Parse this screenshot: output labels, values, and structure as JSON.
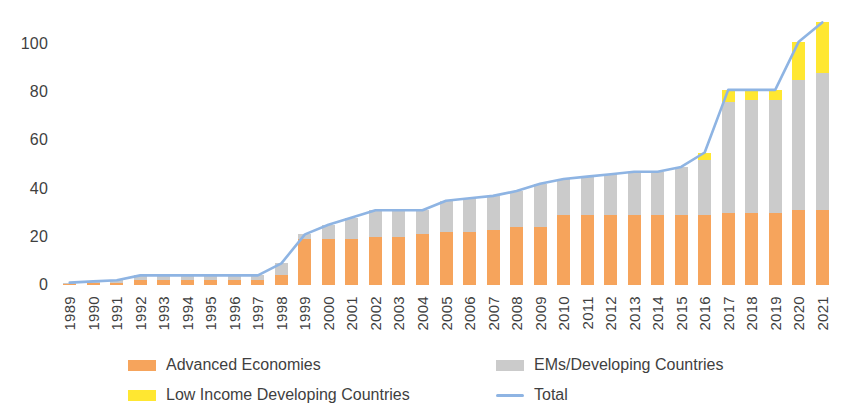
{
  "chart_data": {
    "type": "bar",
    "title": "",
    "subtitle": "",
    "xlabel": "",
    "ylabel": "",
    "stacked": true,
    "grid": false,
    "legend_position": "bottom",
    "ylim": [
      0,
      110
    ],
    "yticks": [
      0,
      20,
      40,
      60,
      80,
      100
    ],
    "categories": [
      "1989",
      "1990",
      "1991",
      "1992",
      "1993",
      "1994",
      "1995",
      "1996",
      "1997",
      "1998",
      "1999",
      "2000",
      "2001",
      "2002",
      "2003",
      "2004",
      "2005",
      "2006",
      "2007",
      "2008",
      "2009",
      "2010",
      "2011",
      "2012",
      "2013",
      "2014",
      "2015",
      "2016",
      "2017",
      "2018",
      "2019",
      "2020",
      "2021"
    ],
    "series": [
      {
        "name": "Advanced Economies",
        "color": "#F6A45C",
        "values": [
          0.5,
          0.7,
          1.0,
          2.0,
          2.0,
          2.0,
          2.0,
          2.0,
          2.0,
          4.0,
          19.0,
          19.0,
          19.0,
          20.0,
          20.0,
          21.0,
          22.0,
          22.0,
          23.0,
          24.0,
          24.0,
          29.0,
          29.0,
          29.0,
          29.0,
          29.0,
          29.0,
          29.0,
          30.0,
          30.0,
          30.0,
          31.0,
          31.0
        ]
      },
      {
        "name": "EMs/Developing Countries",
        "color": "#CBCBCB",
        "values": [
          0.5,
          0.8,
          1.0,
          2.0,
          2.0,
          2.0,
          2.0,
          2.0,
          2.0,
          5.0,
          2.0,
          6.0,
          9.0,
          11.0,
          11.0,
          10.0,
          13.0,
          14.0,
          14.0,
          15.0,
          18.0,
          15.0,
          16.0,
          17.0,
          18.0,
          18.0,
          20.0,
          23.0,
          46.0,
          47.0,
          47.0,
          54.0,
          57.0
        ]
      },
      {
        "name": "Low Income Developing Countries",
        "color": "#FFE731",
        "values": [
          0.0,
          0.0,
          0.0,
          0.0,
          0.0,
          0.0,
          0.0,
          0.0,
          0.0,
          0.0,
          0.0,
          0.0,
          0.0,
          0.0,
          0.0,
          0.0,
          0.0,
          0.0,
          0.0,
          0.0,
          0.0,
          0.0,
          0.0,
          0.0,
          0.0,
          0.0,
          0.0,
          3.0,
          5.0,
          4.0,
          4.0,
          16.0,
          21.0
        ]
      }
    ],
    "total_line": {
      "name": "Total",
      "color": "#8EB4E3",
      "values": [
        1.0,
        1.5,
        2.0,
        4.0,
        4.0,
        4.0,
        4.0,
        4.0,
        4.0,
        9.0,
        21.0,
        25.0,
        28.0,
        31.0,
        31.0,
        31.0,
        35.0,
        36.0,
        37.0,
        39.0,
        42.0,
        44.0,
        45.0,
        46.0,
        47.0,
        47.0,
        49.0,
        55.0,
        81.0,
        81.0,
        81.0,
        101.0,
        109.0
      ]
    },
    "legend": [
      {
        "label": "Advanced Economies",
        "color": "#F6A45C",
        "marker": "box"
      },
      {
        "label": "EMs/Developing Countries",
        "color": "#CBCBCB",
        "marker": "box"
      },
      {
        "label": "Low Income Developing Countries",
        "color": "#FFE731",
        "marker": "box"
      },
      {
        "label": "Total",
        "color": "#8EB4E3",
        "marker": "line"
      }
    ]
  }
}
